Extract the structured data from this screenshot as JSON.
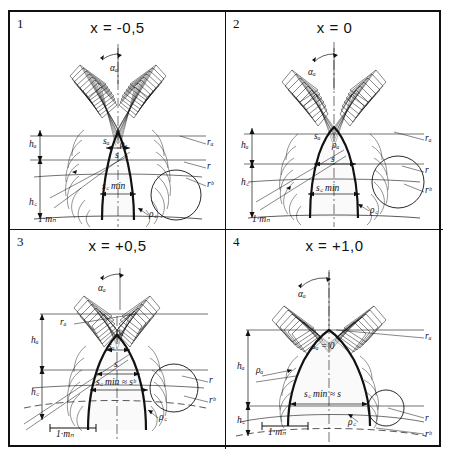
{
  "figure": {
    "type": "technical-diagram",
    "scale_bar_label": "1·mₙ"
  },
  "panels": [
    {
      "number": "1",
      "title_prefix": "x = ",
      "title_value": "-0,5",
      "title": "x = -0,5",
      "labels": {
        "alpha_a": "αₐ",
        "h_a": "hₐ",
        "h_f": "h꜀",
        "s_a": "sₐ",
        "rho_a": "ρₐ",
        "s": "s",
        "s_fmin": "s꜀ min",
        "rho_f": "ρ꜀",
        "r_a": "rₐ",
        "r": "r",
        "r_b": "rᵇ",
        "scale": "1·mₙ"
      }
    },
    {
      "number": "2",
      "title_prefix": "x = ",
      "title_value": "0",
      "title": "x = 0",
      "labels": {
        "alpha_a": "αₐ",
        "h_a": "hₐ",
        "h_f": "h꜀",
        "s_a": "sₐ",
        "rho_a": "ρₐ",
        "s": "s",
        "s_fmin": "s꜀ min",
        "rho_f": "ρ꜀",
        "r_a": "rₐ",
        "r": "r",
        "r_b": "rᵇ",
        "scale": "1·mₙ"
      }
    },
    {
      "number": "3",
      "title_prefix": "x = ",
      "title_value": "+0,5",
      "title": "x = +0,5",
      "labels": {
        "alpha_a": "αₐ",
        "h_a": "hₐ",
        "h_f": "h꜀",
        "s_a": "sₐ",
        "rho_a": "ρₐ",
        "s": "s",
        "s_fmin_approx": "s꜀ min ≈ sᵇ",
        "rho_f": "ρ꜀",
        "r_a": "rₐ",
        "r": "r",
        "r_b": "rᵇ",
        "scale": "1·mₙ"
      }
    },
    {
      "number": "4",
      "title_prefix": "x = ",
      "title_value": "+1,0",
      "title": "x = +1,0",
      "labels": {
        "alpha_a": "αₐ",
        "h_a": "hₐ",
        "h_f": "h꜀",
        "s_a_zero": "sₐ = 0",
        "rho_a": "ρₐ",
        "s_fmin_approx": "s꜀ min ≈ s",
        "rho_f": "ρ꜀",
        "r_a": "rₐ",
        "r": "r",
        "r_b": "rᵇ",
        "scale": "1·mₙ"
      }
    }
  ],
  "colors": {
    "ink": "#111111",
    "fill": "#f2f2f2",
    "paper": "#ffffff"
  }
}
